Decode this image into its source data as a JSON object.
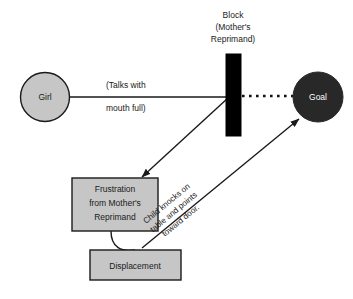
{
  "diagram": {
    "background_color": "#ffffff",
    "stroke_color": "#1a1a1a",
    "box_fill": "#c6c6c6",
    "circle_fill_light": "#c6c6c6",
    "circle_fill_dark": "#282828",
    "block_fill": "#000000",
    "title": {
      "line1": "Block",
      "line2": "(Mother's",
      "line3": "Reprimand)"
    },
    "nodes": {
      "girl": {
        "label": "Girl",
        "shape": "circle",
        "fill": "#c6c6c6"
      },
      "goal": {
        "label": "Goal",
        "shape": "circle",
        "fill": "#282828"
      },
      "block": {
        "label": "",
        "shape": "rect",
        "fill": "#000000"
      },
      "frustration": {
        "line1": "Frustration",
        "line2": "from Mother's",
        "line3": "Reprimand",
        "shape": "rect",
        "fill": "#c6c6c6"
      },
      "displacement": {
        "label": "Displacement",
        "shape": "rect",
        "fill": "#c6c6c6"
      }
    },
    "edges": {
      "talks": {
        "line1": "(Talks with",
        "line2": "mouth full)"
      },
      "knocks": {
        "line1": "Child knocks on",
        "line2": "table and points",
        "line3": "toward door."
      }
    }
  }
}
